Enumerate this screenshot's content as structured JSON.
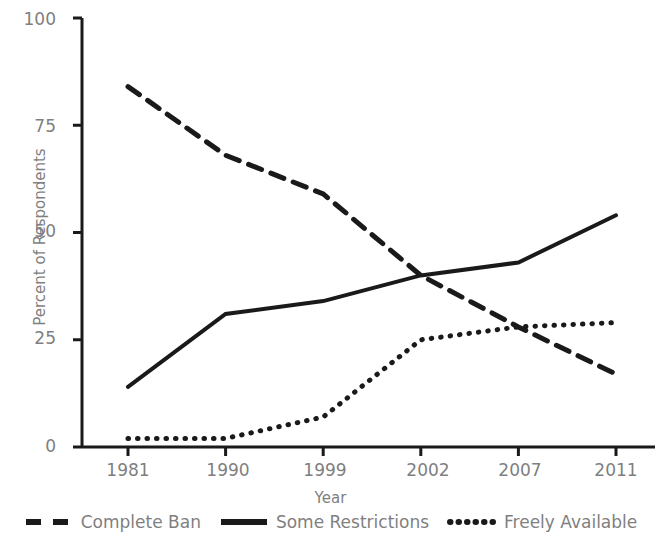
{
  "chart_data": {
    "type": "line",
    "title": "",
    "xlabel": "Year",
    "ylabel": "Percent of Respondents",
    "categories": [
      "1981",
      "1990",
      "1999",
      "2002",
      "2007",
      "2011"
    ],
    "ylim": [
      0,
      100
    ],
    "yticks": [
      "0",
      "25",
      "50",
      "75",
      "100"
    ],
    "ytick_values": [
      0,
      25,
      50,
      75,
      100
    ],
    "grid": false,
    "legend_position": "bottom",
    "series": [
      {
        "name": "Complete Ban",
        "style": "dashed",
        "color": "#1a1a1a",
        "values": [
          84,
          68,
          59,
          40,
          28,
          17
        ]
      },
      {
        "name": "Some Restrictions",
        "style": "solid",
        "color": "#1a1a1a",
        "values": [
          14,
          31,
          34,
          40,
          43,
          54
        ]
      },
      {
        "name": "Freely Available",
        "style": "dotted",
        "color": "#1a1a1a",
        "values": [
          2,
          2,
          7,
          25,
          28,
          29
        ]
      }
    ]
  },
  "axis": {
    "y_title": "Percent of Respondents",
    "x_title": "Year",
    "y_tick_labels": [
      "100",
      "75",
      "50",
      "25",
      "0"
    ],
    "x_tick_labels": [
      "1981",
      "1990",
      "1999",
      "2002",
      "2007",
      "2011"
    ]
  },
  "legend": {
    "entries": [
      {
        "label": "Complete Ban",
        "style": "dashed"
      },
      {
        "label": "Some Restrictions",
        "style": "solid"
      },
      {
        "label": "Freely Available",
        "style": "dotted"
      }
    ]
  },
  "colors": {
    "ink": "#1a1a1a",
    "text": "#7f7f7f",
    "background": "#ffffff"
  }
}
